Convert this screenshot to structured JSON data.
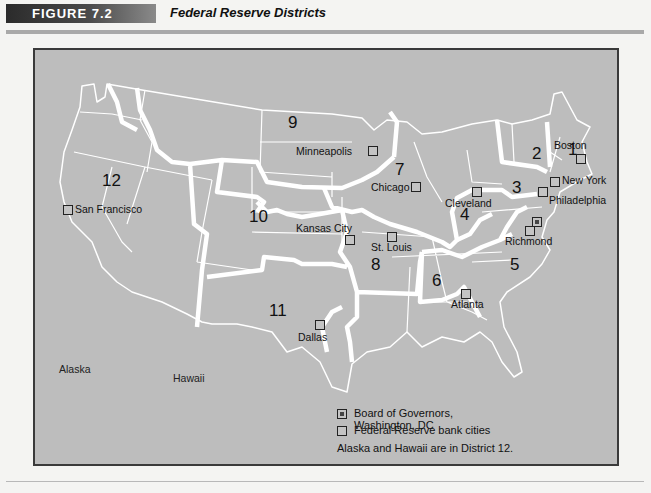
{
  "header": {
    "figure_label": "FIGURE 7.2",
    "title": "Federal Reserve Districts"
  },
  "map": {
    "background_color": "#bdbdbd",
    "boundary_color": "#ffffff",
    "districts": [
      {
        "number": "1",
        "x": 566,
        "y": 143
      },
      {
        "number": "2",
        "x": 530,
        "y": 147
      },
      {
        "number": "3",
        "x": 510,
        "y": 180
      },
      {
        "number": "4",
        "x": 458,
        "y": 207
      },
      {
        "number": "5",
        "x": 508,
        "y": 258
      },
      {
        "number": "6",
        "x": 430,
        "y": 273
      },
      {
        "number": "7",
        "x": 393,
        "y": 162
      },
      {
        "number": "8",
        "x": 369,
        "y": 257
      },
      {
        "number": "9",
        "x": 286,
        "y": 115
      },
      {
        "number": "10",
        "x": 247,
        "y": 209
      },
      {
        "number": "11",
        "x": 267,
        "y": 303
      },
      {
        "number": "12",
        "x": 100,
        "y": 173
      }
    ],
    "bank_cities": [
      {
        "name": "Boston",
        "label_x": 552,
        "label_y": 143,
        "sq_x": 574,
        "sq_y": 154
      },
      {
        "name": "New York",
        "label_x": 560,
        "label_y": 176,
        "sq_x": 548,
        "sq_y": 177
      },
      {
        "name": "Philadelphia",
        "label_x": 547,
        "label_y": 195,
        "sq_x": 536,
        "sq_y": 187
      },
      {
        "name": "Richmond",
        "label_x": 503,
        "label_y": 235,
        "sq_x": 523,
        "sq_y": 226
      },
      {
        "name": "Cleveland",
        "label_x": 443,
        "label_y": 198,
        "sq_x": 470,
        "sq_y": 187
      },
      {
        "name": "Atlanta",
        "label_x": 449,
        "label_y": 296,
        "sq_x": 459,
        "sq_y": 289
      },
      {
        "name": "Chicago",
        "label_x": 369,
        "label_y": 181,
        "sq_x": 409,
        "sq_y": 182
      },
      {
        "name": "St. Louis",
        "label_x": 369,
        "label_y": 240,
        "sq_x": 386,
        "sq_y": 232
      },
      {
        "name": "Minneapolis",
        "label_x": 294,
        "label_y": 145,
        "sq_x": 366,
        "sq_y": 146
      },
      {
        "name": "Kansas City",
        "label_x": 294,
        "label_y": 221,
        "sq_x": 343,
        "sq_y": 235
      },
      {
        "name": "Dallas",
        "label_x": 296,
        "label_y": 331,
        "sq_x": 313,
        "sq_y": 320
      },
      {
        "name": "San Francisco",
        "label_x": 72,
        "label_y": 203,
        "sq_x": 61,
        "sq_y": 205
      }
    ],
    "board_of_governors": {
      "name": "Washington, DC",
      "sq_x": 530,
      "sq_y": 217
    },
    "other_labels": [
      {
        "name": "Alaska",
        "x": 57,
        "y": 362
      },
      {
        "name": "Hawaii",
        "x": 171,
        "y": 371
      }
    ]
  },
  "legend": {
    "board_label": "Board of Governors, Washington, DC",
    "bank_cities_label": "Federal Reserve bank cities",
    "note": "Alaska and Hawaii are in District 12."
  }
}
